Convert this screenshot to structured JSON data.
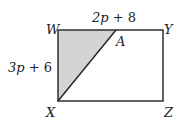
{
  "diagram": {
    "type": "rectangle-with-shaded-triangle",
    "vertices": {
      "W": "W",
      "Y": "Y",
      "X": "X",
      "Z": "Z",
      "A": "A"
    },
    "labels": {
      "top_side": {
        "var": "2p",
        "rest": " + 8"
      },
      "left_side": {
        "var": "3p",
        "rest": " + 6"
      }
    },
    "shaded_region": "triangle WAX",
    "colors": {
      "stroke": "#222222",
      "shade": "#d4d4d4",
      "background": "#ffffff"
    }
  }
}
